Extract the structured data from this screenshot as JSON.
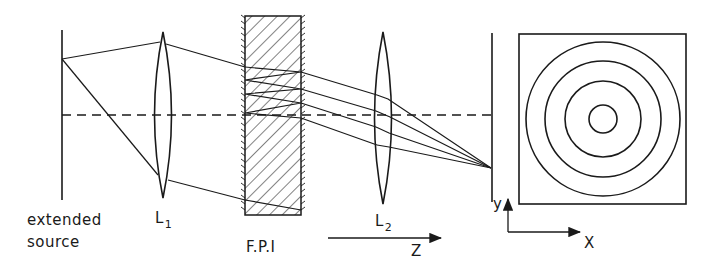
{
  "figure": {
    "labels": {
      "source_line1": "extended",
      "source_line2": "source",
      "lens1_main": "L",
      "lens1_sub": "1",
      "fpi": "F.P.I",
      "lens2_main": "L",
      "lens2_sub": "2",
      "z_axis": "Z",
      "y_axis": "y",
      "x_axis": "X"
    },
    "colors": {
      "stroke": "#1a1a1a",
      "background": "#ffffff"
    },
    "fringes": {
      "count": 4,
      "radii": [
        77,
        58,
        38,
        14
      ]
    }
  }
}
